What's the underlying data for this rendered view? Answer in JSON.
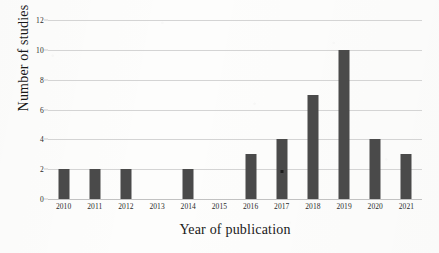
{
  "chart_data": {
    "type": "bar",
    "title": "",
    "xlabel": "Year of publication",
    "ylabel": "Number of studies",
    "categories": [
      "2010",
      "2011",
      "2012",
      "2013",
      "2014",
      "2015",
      "2016",
      "2017",
      "2018",
      "2019",
      "2020",
      "2021"
    ],
    "values": [
      2,
      2,
      2,
      0,
      2,
      0,
      3,
      4,
      7,
      10,
      4,
      3
    ],
    "ylim": [
      0,
      12
    ],
    "yticks": [
      "0",
      "2",
      "4",
      "6",
      "8",
      "10",
      "12"
    ],
    "ytick_values": [
      0,
      2,
      4,
      6,
      8,
      10,
      12
    ],
    "grid": "horizontal",
    "legend": "none",
    "bar_color": "#4a4a4a",
    "gridline_color": "#d4d4d4",
    "background_color": "#fdfdfc"
  }
}
